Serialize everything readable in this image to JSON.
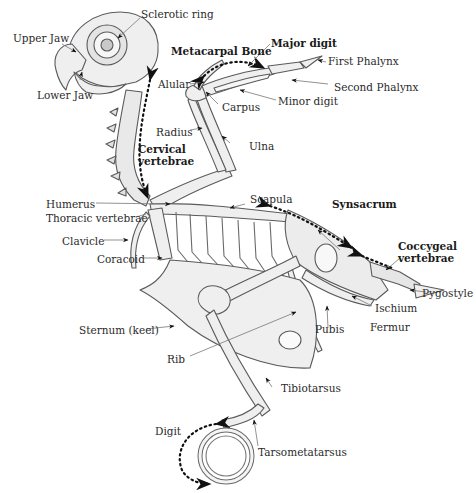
{
  "figure": {
    "colors": {
      "line": "#5a5a5a",
      "bone_fill": "#efefef",
      "shade": "#d8d8d8",
      "arrow": "#111111",
      "text": "#2a2a2a"
    }
  },
  "labels": {
    "sclerotic_ring": "Sclerotic ring",
    "upper_jaw": "Upper Jaw",
    "lower_jaw": "Lower Jaw",
    "metacarpal_bone": "Metacarpal Bone",
    "major_digit": "Major digit",
    "first_phalynx": "First Phalynx",
    "second_phalynx": "Second Phalynx",
    "alular": "Alular",
    "carpus": "Carpus",
    "minor_digit": "Minor digit",
    "radius": "Radius",
    "ulna": "Ulna",
    "cervical_vertebrae_1": "Cervical",
    "cervical_vertebrae_2": "vertebrae",
    "humerus": "Humerus",
    "scapula": "Scapula",
    "synsacrum": "Synsacrum",
    "thoracic_vertebrae": "Thoracic vertebrae",
    "clavicle": "Clavicle",
    "coracoid": "Coracoid",
    "coccygeal_vertebrae_1": "Coccygeal",
    "coccygeal_vertebrae_2": "vertebrae",
    "pygostyle": "Pygostyle",
    "ischium": "Ischium",
    "sternum": "Sternum (keel)",
    "pubis": "Pubis",
    "fermur": "Fermur",
    "rib": "Rib",
    "tibiotarsus": "Tibiotarsus",
    "digit": "Digit",
    "tarsometatarsus": "Tarsometatarsus"
  }
}
